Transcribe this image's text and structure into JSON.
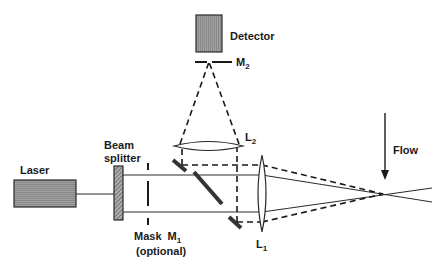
{
  "diagram": {
    "labels": {
      "laser": "Laser",
      "beam_splitter_line1": "Beam",
      "beam_splitter_line2": "splitter",
      "mask": "Mask",
      "m1": "M",
      "m1_sub": "1",
      "optional": "(optional)",
      "detector": "Detector",
      "m2": "M",
      "m2_sub": "2",
      "l1": "L",
      "l1_sub": "1",
      "l2": "L",
      "l2_sub": "2",
      "flow": "Flow"
    },
    "colors": {
      "stroke": "#2a2a2a",
      "box_fill": "#9a9a9a",
      "background": "#ffffff"
    },
    "components": [
      {
        "name": "Laser",
        "type": "source"
      },
      {
        "name": "Beam splitter",
        "type": "splitter"
      },
      {
        "name": "Mask M1",
        "type": "aperture",
        "note": "optional"
      },
      {
        "name": "Mirrors",
        "type": "mirror",
        "count": 3
      },
      {
        "name": "L1",
        "type": "lens"
      },
      {
        "name": "L2",
        "type": "lens"
      },
      {
        "name": "M2",
        "type": "aperture"
      },
      {
        "name": "Detector",
        "type": "detector"
      },
      {
        "name": "Flow",
        "type": "direction-arrow",
        "direction": "down"
      }
    ]
  }
}
